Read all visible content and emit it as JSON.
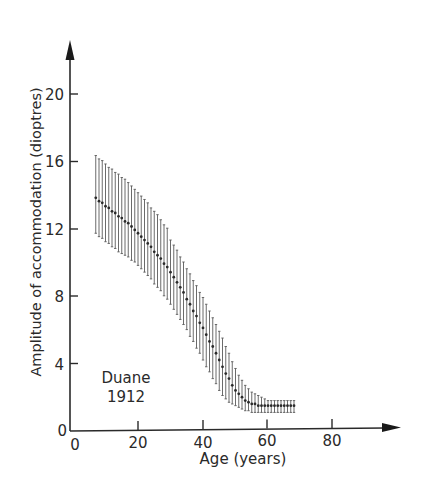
{
  "chart_data": {
    "type": "errorbar",
    "title": "",
    "xlabel": "Age (years)",
    "ylabel": "Amplitude of accommodation (dioptres)",
    "xlim": [
      0,
      100
    ],
    "ylim": [
      0,
      23
    ],
    "xticks": [
      0,
      20,
      40,
      60,
      80
    ],
    "yticks": [
      0,
      4,
      8,
      12,
      16,
      20
    ],
    "grid": false,
    "annotation": {
      "text_line1": "Duane",
      "text_line2": "1912",
      "x": 15,
      "y": 2.6
    },
    "series": [
      {
        "name": "Duane 1912",
        "x": [
          7,
          8,
          9,
          10,
          11,
          12,
          13,
          14,
          15,
          16,
          17,
          18,
          19,
          20,
          21,
          22,
          23,
          24,
          25,
          26,
          27,
          28,
          29,
          30,
          31,
          32,
          33,
          34,
          35,
          36,
          37,
          38,
          39,
          40,
          41,
          42,
          43,
          44,
          45,
          46,
          47,
          48,
          49,
          50,
          51,
          52,
          53,
          54,
          55,
          56,
          57,
          58,
          59,
          60,
          61,
          62,
          63,
          64,
          65,
          66,
          67,
          68
        ],
        "mean": [
          13.8,
          13.6,
          13.5,
          13.3,
          13.2,
          13.0,
          12.9,
          12.7,
          12.6,
          12.4,
          12.3,
          12.1,
          11.9,
          11.7,
          11.5,
          11.3,
          11.1,
          10.9,
          10.6,
          10.4,
          10.2,
          9.9,
          9.7,
          9.4,
          9.1,
          8.8,
          8.5,
          8.2,
          7.8,
          7.5,
          7.1,
          6.8,
          6.4,
          6.1,
          5.7,
          5.3,
          5.0,
          4.6,
          4.2,
          3.8,
          3.4,
          3.1,
          2.7,
          2.4,
          2.2,
          2.0,
          1.8,
          1.7,
          1.6,
          1.6,
          1.5,
          1.5,
          1.5,
          1.5,
          1.5,
          1.5,
          1.5,
          1.5,
          1.5,
          1.5,
          1.5,
          1.5
        ],
        "upper": [
          16.3,
          16.1,
          16.0,
          15.8,
          15.6,
          15.5,
          15.3,
          15.2,
          15.0,
          14.9,
          14.7,
          14.5,
          14.3,
          14.1,
          13.9,
          13.7,
          13.5,
          13.2,
          13.0,
          12.8,
          12.5,
          12.2,
          12.0,
          11.3,
          11.0,
          10.7,
          10.3,
          10.0,
          9.6,
          9.3,
          8.9,
          8.6,
          8.2,
          7.9,
          7.5,
          7.1,
          6.7,
          6.3,
          5.9,
          5.5,
          5.0,
          4.6,
          4.1,
          3.7,
          3.3,
          3.0,
          2.7,
          2.5,
          2.3,
          2.2,
          2.1,
          2.0,
          1.9,
          1.8,
          1.8,
          1.8,
          1.8,
          1.8,
          1.8,
          1.8,
          1.8,
          1.8
        ],
        "lower": [
          11.7,
          11.5,
          11.4,
          11.2,
          11.1,
          10.9,
          10.8,
          10.6,
          10.5,
          10.4,
          10.3,
          10.1,
          10.0,
          9.8,
          9.6,
          9.4,
          9.2,
          9.0,
          8.7,
          8.5,
          8.3,
          8.0,
          7.8,
          7.5,
          7.2,
          6.9,
          6.6,
          6.3,
          6.0,
          5.6,
          5.3,
          4.9,
          4.6,
          4.2,
          3.8,
          3.5,
          3.1,
          2.8,
          2.4,
          2.1,
          1.9,
          1.7,
          1.6,
          1.5,
          1.4,
          1.3,
          1.2,
          1.2,
          1.1,
          1.1,
          1.1,
          1.1,
          1.1,
          1.1,
          1.1,
          1.1,
          1.1,
          1.1,
          1.1,
          1.1,
          1.1,
          1.1
        ]
      }
    ]
  },
  "labels": {
    "xlabel": "Age (years)",
    "ylabel": "Amplitude of accommodation (dioptres)",
    "annotation_line1": "Duane",
    "annotation_line2": "1912",
    "xtick_0": "0",
    "xtick_20": "20",
    "xtick_40": "40",
    "xtick_60": "60",
    "xtick_80": "80",
    "ytick_0": "0",
    "ytick_4": "4",
    "ytick_8": "8",
    "ytick_12": "12",
    "ytick_16": "16",
    "ytick_20": "20"
  },
  "colors": {
    "ink": "#2a2a2a",
    "bars": "#5a5a5a",
    "background": "#ffffff"
  }
}
